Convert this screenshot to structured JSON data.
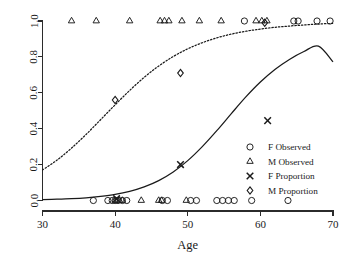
{
  "chart_data": {
    "type": "scatter",
    "title": "",
    "subtitle": "",
    "xlabel": "Age",
    "ylabel": "",
    "xlim": [
      30,
      70
    ],
    "ylim": [
      0.0,
      1.0
    ],
    "xticks": [
      30,
      40,
      50,
      60,
      70
    ],
    "xtick_labels": [
      "30",
      "40",
      "50",
      "60",
      "70"
    ],
    "yticks": [
      0.0,
      0.2,
      0.4,
      0.6,
      0.8,
      1.0
    ],
    "ytick_labels": [
      "0.0",
      "0.2",
      "0.4",
      "0.6",
      "0.8",
      "1.0"
    ],
    "grid": false,
    "legend_position": "right-middle",
    "legend": [
      {
        "key": "f-observed",
        "label": "F Observed",
        "marker": "circle"
      },
      {
        "key": "m-observed",
        "label": "M Observed",
        "marker": "triangle"
      },
      {
        "key": "f-proportion",
        "label": "F Proportion",
        "marker": "cross"
      },
      {
        "key": "m-proportion",
        "label": "M Proportion",
        "marker": "diamond"
      }
    ],
    "series": [
      {
        "name": "F Observed",
        "marker": "circle",
        "points": [
          [
            37.0,
            0.0
          ],
          [
            39.0,
            0.0
          ],
          [
            39.6,
            0.0
          ],
          [
            40.0,
            0.0
          ],
          [
            40.4,
            0.0
          ],
          [
            41.0,
            0.0
          ],
          [
            41.6,
            0.0
          ],
          [
            46.5,
            0.0
          ],
          [
            47.2,
            0.0
          ],
          [
            50.4,
            0.0
          ],
          [
            51.2,
            0.0
          ],
          [
            54.0,
            0.0
          ],
          [
            54.8,
            0.0
          ],
          [
            55.6,
            0.0
          ],
          [
            56.4,
            0.0
          ],
          [
            58.8,
            0.0
          ],
          [
            63.8,
            0.0
          ],
          [
            57.8,
            1.0
          ],
          [
            64.6,
            1.0
          ],
          [
            65.2,
            1.0
          ],
          [
            67.8,
            1.0
          ],
          [
            69.6,
            1.0
          ]
        ]
      },
      {
        "name": "M Observed",
        "marker": "triangle",
        "points": [
          [
            40.0,
            0.0
          ],
          [
            40.6,
            0.0
          ],
          [
            41.0,
            0.0
          ],
          [
            43.6,
            0.0
          ],
          [
            46.0,
            0.0
          ],
          [
            46.4,
            0.0
          ],
          [
            49.8,
            0.0
          ],
          [
            34.0,
            1.0
          ],
          [
            37.4,
            1.0
          ],
          [
            42.0,
            1.0
          ],
          [
            46.2,
            1.0
          ],
          [
            46.8,
            1.0
          ],
          [
            47.4,
            1.0
          ],
          [
            49.2,
            1.0
          ],
          [
            51.6,
            1.0
          ],
          [
            54.6,
            1.0
          ],
          [
            59.4,
            1.0
          ],
          [
            60.2,
            1.0
          ],
          [
            60.9,
            1.0
          ]
        ]
      },
      {
        "name": "F Proportion",
        "marker": "cross",
        "points": [
          [
            40.2,
            0.01
          ],
          [
            49.0,
            0.2
          ],
          [
            61.0,
            0.445
          ]
        ]
      },
      {
        "name": "M Proportion",
        "marker": "diamond",
        "points": [
          [
            40.0,
            0.56
          ],
          [
            49.0,
            0.71
          ],
          [
            60.6,
            0.99
          ]
        ]
      }
    ],
    "curves": [
      {
        "name": "F fitted logistic",
        "style": "solid",
        "model": "logistic",
        "points": [
          [
            30,
            0.005
          ],
          [
            32,
            0.007
          ],
          [
            34,
            0.01
          ],
          [
            36,
            0.015
          ],
          [
            38,
            0.023
          ],
          [
            40,
            0.034
          ],
          [
            42,
            0.051
          ],
          [
            44,
            0.076
          ],
          [
            46,
            0.111
          ],
          [
            48,
            0.159
          ],
          [
            50,
            0.222
          ],
          [
            52,
            0.3
          ],
          [
            54,
            0.389
          ],
          [
            56,
            0.484
          ],
          [
            58,
            0.577
          ],
          [
            60,
            0.66
          ],
          [
            62,
            0.73
          ],
          [
            64,
            0.786
          ],
          [
            66,
            0.83
          ],
          [
            68,
            0.86
          ],
          [
            70,
            0.772
          ]
        ]
      },
      {
        "name": "M fitted logistic",
        "style": "dotted",
        "model": "logistic",
        "points": [
          [
            30,
            0.17
          ],
          [
            32,
            0.225
          ],
          [
            34,
            0.292
          ],
          [
            36,
            0.368
          ],
          [
            38,
            0.45
          ],
          [
            40,
            0.533
          ],
          [
            42,
            0.613
          ],
          [
            44,
            0.686
          ],
          [
            46,
            0.749
          ],
          [
            48,
            0.802
          ],
          [
            50,
            0.845
          ],
          [
            52,
            0.879
          ],
          [
            54,
            0.906
          ],
          [
            56,
            0.927
          ],
          [
            58,
            0.943
          ],
          [
            60,
            0.955
          ],
          [
            62,
            0.965
          ],
          [
            64,
            0.972
          ],
          [
            66,
            0.978
          ],
          [
            68,
            0.983
          ],
          [
            70,
            0.987
          ]
        ]
      }
    ]
  }
}
